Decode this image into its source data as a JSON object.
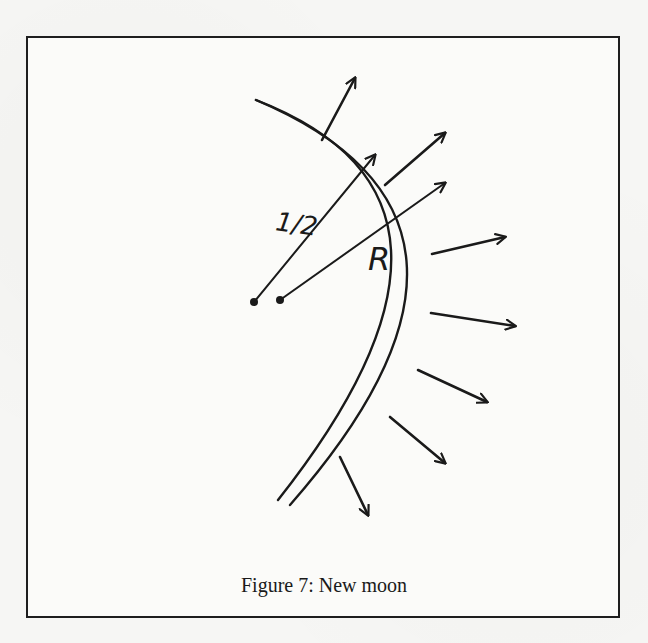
{
  "figure": {
    "caption": "Figure 7:  New moon",
    "labels": {
      "half_radius": "1/2",
      "radius": "R"
    },
    "colors": {
      "ink": "#1a1a1a",
      "paper": "#f6f6f4",
      "frame": "#1e1e1e"
    },
    "arcs": {
      "inner": {
        "start": [
          256,
          100
        ],
        "control": [
          515,
          200
        ],
        "end": [
          278,
          500
        ]
      },
      "outer": {
        "start": [
          256,
          100
        ],
        "control": [
          540,
          220
        ],
        "end": [
          290,
          505
        ]
      }
    },
    "radii": [
      {
        "name": "half-radius-line",
        "from": [
          254,
          302
        ],
        "to": [
          375,
          155
        ]
      },
      {
        "name": "radius-line",
        "from": [
          280,
          300
        ],
        "to": [
          445,
          183
        ]
      }
    ],
    "normal_arrows": [
      {
        "from": [
          322,
          140
        ],
        "to": [
          355,
          78
        ]
      },
      {
        "from": [
          385,
          185
        ],
        "to": [
          445,
          133
        ]
      },
      {
        "from": [
          432,
          254
        ],
        "to": [
          505,
          237
        ]
      },
      {
        "from": [
          431,
          313
        ],
        "to": [
          515,
          326
        ]
      },
      {
        "from": [
          418,
          370
        ],
        "to": [
          487,
          402
        ]
      },
      {
        "from": [
          390,
          417
        ],
        "to": [
          445,
          463
        ]
      },
      {
        "from": [
          340,
          457
        ],
        "to": [
          368,
          515
        ]
      }
    ]
  }
}
